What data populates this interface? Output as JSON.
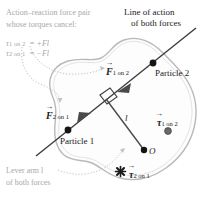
{
  "figure": {
    "colors": {
      "body_outline": "#b9b9b9",
      "body_fill": "#fdfdfd",
      "line_of_action": "#3d3d3d",
      "leader_line": "#bdbdbd",
      "caption_gray": "#a8a8a8",
      "caption_dark": "#1c1c1c",
      "point_dot": "#141414",
      "torque_out_dot": "#555555"
    }
  },
  "annotations": {
    "action_reaction": {
      "line1": "Action–reaction force pair",
      "line2": "whose torques cancel:",
      "eq1_symbol": "τ",
      "eq1_sub": "1 on 2",
      "eq1_value": "= +Fl",
      "eq2_symbol": "τ",
      "eq2_sub": "2 on 1",
      "eq2_value": "= −Fl"
    },
    "line_of_action": {
      "line1": "Line of action",
      "line2": "of both forces"
    },
    "lever_arm": {
      "line1": "Lever arm l",
      "line2": "of both forces"
    }
  },
  "labels": {
    "force_1on2": {
      "symbol": "F",
      "sub": "1 on 2"
    },
    "force_2on1": {
      "symbol": "F",
      "sub": "2 on 1"
    },
    "torque_1on2": {
      "symbol": "τ",
      "sub": "1 on 2"
    },
    "torque_2on1": {
      "symbol": "τ",
      "sub": "2 on 1"
    },
    "particle_2": "Particle 2",
    "particle_1": "Particle 1",
    "lever_arm_l": "l",
    "origin": "O"
  },
  "symbols": {
    "torque_out_of_page": "●",
    "torque_into_page": "✖"
  }
}
